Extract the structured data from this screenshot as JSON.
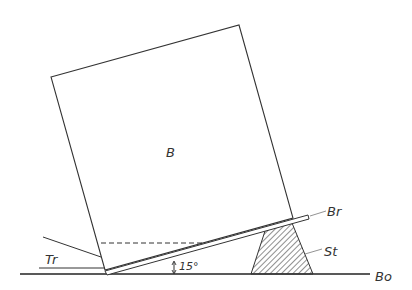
{
  "diagram": {
    "labels": {
      "box": "B",
      "board": "Br",
      "stand": "St",
      "floor": "Bo",
      "tr": "Tr",
      "angle": "15°"
    },
    "colors": {
      "line": "#333333",
      "background": "#ffffff"
    }
  }
}
